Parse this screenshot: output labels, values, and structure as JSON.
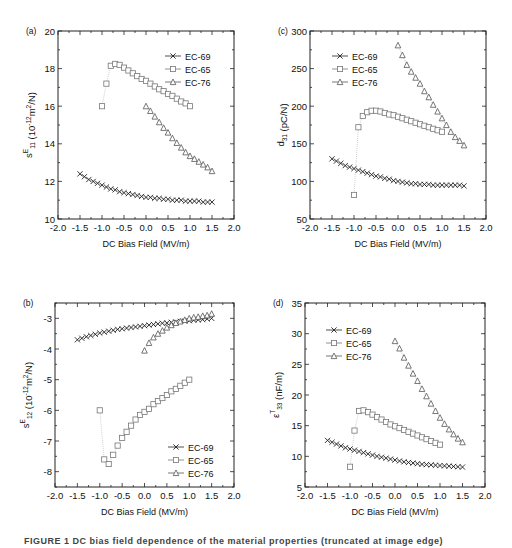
{
  "figure": {
    "caption_visible_fragment": "FIGURE 1 DC bias field dependence of the material properties (truncated at image edge)",
    "common_xlabel": "DC Bias Field (MV/m)"
  },
  "chart_data": [
    {
      "panel": "(a)",
      "type": "scatter",
      "title": "",
      "xlabel": "DC Bias Field (MV/m)",
      "ylabel": "s^E_11 (10^-12 m^2/N)",
      "ylabel_parts": {
        "base": "s",
        "sup": "E",
        "sub": "11",
        "unit": " (10",
        "unit_sup": "-12",
        "unit_tail": "m",
        "unit_sup2": "2",
        "unit_end": "/N)"
      },
      "xlim": [
        -2.0,
        2.0
      ],
      "ylim": [
        10,
        20
      ],
      "xticks": [
        -2.0,
        -1.5,
        -1.0,
        -0.5,
        0.0,
        0.5,
        1.0,
        1.5,
        2.0
      ],
      "yticks": [
        10,
        12,
        14,
        16,
        18,
        20
      ],
      "grid": false,
      "legend_position": "upper right",
      "frame": {
        "x0": 58,
        "y0": 31,
        "x1": 234,
        "y1": 219
      },
      "legend": {
        "x": 165,
        "y": 56
      },
      "series": [
        {
          "name": "EC-69",
          "marker": "x",
          "color": "#222222",
          "x": [
            -1.5,
            -1.4,
            -1.3,
            -1.2,
            -1.1,
            -1.0,
            -0.9,
            -0.8,
            -0.7,
            -0.6,
            -0.5,
            -0.4,
            -0.3,
            -0.2,
            -0.1,
            0.0,
            0.1,
            0.2,
            0.3,
            0.4,
            0.5,
            0.6,
            0.7,
            0.8,
            0.9,
            1.0,
            1.1,
            1.2,
            1.3,
            1.4,
            1.5
          ],
          "y": [
            12.4,
            12.25,
            12.1,
            12.0,
            11.9,
            11.8,
            11.7,
            11.6,
            11.55,
            11.45,
            11.4,
            11.35,
            11.3,
            11.25,
            11.2,
            11.15,
            11.15,
            11.1,
            11.1,
            11.05,
            11.05,
            11.0,
            11.0,
            11.0,
            10.95,
            10.95,
            10.95,
            10.95,
            10.9,
            10.9,
            10.9
          ]
        },
        {
          "name": "EC-65",
          "marker": "square",
          "color": "#777777",
          "x": [
            -1.0,
            -0.9,
            -0.8,
            -0.7,
            -0.6,
            -0.5,
            -0.4,
            -0.3,
            -0.2,
            -0.1,
            0.0,
            0.1,
            0.2,
            0.3,
            0.4,
            0.5,
            0.6,
            0.7,
            0.8,
            0.9,
            1.0
          ],
          "y": [
            16.0,
            17.2,
            18.15,
            18.25,
            18.2,
            18.05,
            17.9,
            17.75,
            17.6,
            17.45,
            17.35,
            17.2,
            17.05,
            16.9,
            16.8,
            16.65,
            16.55,
            16.4,
            16.25,
            16.15,
            16.0
          ]
        },
        {
          "name": "EC-76",
          "marker": "triangle",
          "color": "#555555",
          "x": [
            0.0,
            0.1,
            0.2,
            0.3,
            0.4,
            0.5,
            0.6,
            0.7,
            0.8,
            0.9,
            1.0,
            1.1,
            1.2,
            1.3,
            1.4,
            1.5
          ],
          "y": [
            16.0,
            15.75,
            15.45,
            15.15,
            14.85,
            14.6,
            14.3,
            14.05,
            13.8,
            13.55,
            13.35,
            13.2,
            13.05,
            12.9,
            12.75,
            12.55
          ]
        }
      ]
    },
    {
      "panel": "(c)",
      "type": "scatter",
      "title": "",
      "xlabel": "DC Bias Field (MV/m)",
      "ylabel": "d_31 (pC/N)",
      "ylabel_parts": {
        "base": "d",
        "sup": "",
        "sub": "31",
        "unit": " (pC/N)",
        "unit_sup": "",
        "unit_tail": "",
        "unit_sup2": "",
        "unit_end": ""
      },
      "xlim": [
        -2.0,
        2.0
      ],
      "ylim": [
        50,
        300
      ],
      "xticks": [
        -2.0,
        -1.5,
        -1.0,
        -0.5,
        0.0,
        0.5,
        1.0,
        1.5,
        2.0
      ],
      "yticks": [
        50,
        100,
        150,
        200,
        250,
        300
      ],
      "grid": false,
      "legend_position": "upper left",
      "frame": {
        "x0": 310,
        "y0": 31,
        "x1": 486,
        "y1": 219
      },
      "legend": {
        "x": 332,
        "y": 56
      },
      "series": [
        {
          "name": "EC-69",
          "marker": "x",
          "color": "#222222",
          "x": [
            -1.5,
            -1.4,
            -1.3,
            -1.2,
            -1.1,
            -1.0,
            -0.9,
            -0.8,
            -0.7,
            -0.6,
            -0.5,
            -0.4,
            -0.3,
            -0.2,
            -0.1,
            0.0,
            0.1,
            0.2,
            0.3,
            0.4,
            0.5,
            0.6,
            0.7,
            0.8,
            0.9,
            1.0,
            1.1,
            1.2,
            1.3,
            1.4,
            1.5
          ],
          "y": [
            130,
            127,
            124,
            121,
            119,
            117,
            115,
            113,
            111,
            109,
            107,
            106,
            104,
            103,
            101,
            100,
            99,
            98,
            97,
            97,
            96,
            96,
            96,
            95,
            95,
            95,
            95,
            95,
            95,
            95,
            94
          ]
        },
        {
          "name": "EC-65",
          "marker": "square",
          "color": "#777777",
          "x": [
            -1.0,
            -0.9,
            -0.8,
            -0.7,
            -0.6,
            -0.5,
            -0.4,
            -0.3,
            -0.2,
            -0.1,
            0.0,
            0.1,
            0.2,
            0.3,
            0.4,
            0.5,
            0.6,
            0.7,
            0.8,
            0.9,
            1.0
          ],
          "y": [
            82,
            172,
            187,
            192,
            194,
            194,
            193,
            191,
            189,
            188,
            186,
            184,
            182,
            180,
            178,
            176,
            174,
            172,
            170,
            168,
            166
          ]
        },
        {
          "name": "EC-76",
          "marker": "triangle",
          "color": "#555555",
          "x": [
            0.0,
            0.1,
            0.2,
            0.3,
            0.4,
            0.5,
            0.6,
            0.7,
            0.8,
            0.9,
            1.0,
            1.1,
            1.2,
            1.3,
            1.4,
            1.5
          ],
          "y": [
            281,
            268,
            255,
            246,
            238,
            230,
            220,
            212,
            202,
            193,
            184,
            175,
            166,
            159,
            154,
            148
          ]
        }
      ]
    },
    {
      "panel": "(b)",
      "type": "scatter",
      "title": "",
      "xlabel": "DC Bias Field (MV/m)",
      "ylabel": "s^E_12 (10^-12 m^2/N)",
      "ylabel_parts": {
        "base": "s",
        "sup": "E",
        "sub": "12",
        "unit": " (10",
        "unit_sup": "-12",
        "unit_tail": "m",
        "unit_sup2": "2",
        "unit_end": "/N)"
      },
      "xlim": [
        -2.0,
        2.0
      ],
      "ylim": [
        -8.5,
        -2.5
      ],
      "xticks": [
        -2.0,
        -1.5,
        -1.0,
        -0.5,
        0.0,
        0.5,
        1.0,
        1.5,
        2.0
      ],
      "yticks": [
        -8,
        -7,
        -6,
        -5,
        -4,
        -3
      ],
      "grid": false,
      "legend_position": "lower right",
      "frame": {
        "x0": 55,
        "y0": 303,
        "x1": 234,
        "y1": 487
      },
      "legend": {
        "x": 168,
        "y": 447
      },
      "series": [
        {
          "name": "EC-69",
          "marker": "x",
          "color": "#222222",
          "x": [
            -1.5,
            -1.4,
            -1.3,
            -1.2,
            -1.1,
            -1.0,
            -0.9,
            -0.8,
            -0.7,
            -0.6,
            -0.5,
            -0.4,
            -0.3,
            -0.2,
            -0.1,
            0.0,
            0.1,
            0.2,
            0.3,
            0.4,
            0.5,
            0.6,
            0.7,
            0.8,
            0.9,
            1.0,
            1.1,
            1.2,
            1.3,
            1.4,
            1.5
          ],
          "y": [
            -3.7,
            -3.65,
            -3.6,
            -3.56,
            -3.52,
            -3.48,
            -3.45,
            -3.42,
            -3.39,
            -3.36,
            -3.34,
            -3.32,
            -3.3,
            -3.28,
            -3.26,
            -3.24,
            -3.22,
            -3.2,
            -3.18,
            -3.16,
            -3.15,
            -3.13,
            -3.12,
            -3.1,
            -3.09,
            -3.08,
            -3.06,
            -3.05,
            -3.04,
            -3.02,
            -3.0
          ]
        },
        {
          "name": "EC-65",
          "marker": "square",
          "color": "#777777",
          "x": [
            -1.0,
            -0.9,
            -0.8,
            -0.7,
            -0.6,
            -0.5,
            -0.4,
            -0.3,
            -0.2,
            -0.1,
            0.0,
            0.1,
            0.2,
            0.3,
            0.4,
            0.5,
            0.6,
            0.7,
            0.8,
            0.9,
            1.0
          ],
          "y": [
            -6.0,
            -7.6,
            -7.75,
            -7.45,
            -7.15,
            -6.9,
            -6.7,
            -6.5,
            -6.3,
            -6.15,
            -6.05,
            -5.95,
            -5.8,
            -5.7,
            -5.6,
            -5.5,
            -5.38,
            -5.3,
            -5.2,
            -5.1,
            -5.0
          ]
        },
        {
          "name": "EC-76",
          "marker": "triangle",
          "color": "#555555",
          "x": [
            0.0,
            0.1,
            0.2,
            0.3,
            0.4,
            0.5,
            0.6,
            0.7,
            0.8,
            0.9,
            1.0,
            1.1,
            1.2,
            1.3,
            1.4,
            1.5
          ],
          "y": [
            -4.05,
            -3.8,
            -3.62,
            -3.5,
            -3.4,
            -3.3,
            -3.22,
            -3.15,
            -3.1,
            -3.05,
            -3.0,
            -2.97,
            -2.95,
            -2.92,
            -2.9,
            -2.85
          ]
        }
      ]
    },
    {
      "panel": "(d)",
      "type": "scatter",
      "title": "",
      "xlabel": "DC Bias Field (MV/m)",
      "ylabel": "ε^T_33 (nF/m)",
      "ylabel_parts": {
        "base": "ε",
        "sup": "T",
        "sub": "33",
        "unit": " (nF/m)",
        "unit_sup": "",
        "unit_tail": "",
        "unit_sup2": "",
        "unit_end": ""
      },
      "xlim": [
        -2.0,
        2.0
      ],
      "ylim": [
        5,
        35
      ],
      "xticks": [
        -2.0,
        -1.5,
        -1.0,
        -0.5,
        0.0,
        0.5,
        1.0,
        1.5,
        2.0
      ],
      "yticks": [
        5,
        10,
        15,
        20,
        25,
        30,
        35
      ],
      "grid": false,
      "legend_position": "upper left",
      "frame": {
        "x0": 305,
        "y0": 303,
        "x1": 485,
        "y1": 487
      },
      "legend": {
        "x": 326,
        "y": 330
      },
      "series": [
        {
          "name": "EC-69",
          "marker": "x",
          "color": "#222222",
          "x": [
            -1.5,
            -1.4,
            -1.3,
            -1.2,
            -1.1,
            -1.0,
            -0.9,
            -0.8,
            -0.7,
            -0.6,
            -0.5,
            -0.4,
            -0.3,
            -0.2,
            -0.1,
            0.0,
            0.1,
            0.2,
            0.3,
            0.4,
            0.5,
            0.6,
            0.7,
            0.8,
            0.9,
            1.0,
            1.1,
            1.2,
            1.3,
            1.4,
            1.5
          ],
          "y": [
            12.6,
            12.3,
            12.0,
            11.7,
            11.4,
            11.2,
            11.0,
            10.8,
            10.6,
            10.4,
            10.2,
            10.0,
            9.85,
            9.7,
            9.55,
            9.4,
            9.25,
            9.1,
            9.0,
            8.9,
            8.8,
            8.7,
            8.65,
            8.6,
            8.55,
            8.5,
            8.45,
            8.4,
            8.35,
            8.3,
            8.25
          ]
        },
        {
          "name": "EC-65",
          "marker": "square",
          "color": "#777777",
          "x": [
            -1.0,
            -0.9,
            -0.8,
            -0.7,
            -0.6,
            -0.5,
            -0.4,
            -0.3,
            -0.2,
            -0.1,
            0.0,
            0.1,
            0.2,
            0.3,
            0.4,
            0.5,
            0.6,
            0.7,
            0.8,
            0.9,
            1.0
          ],
          "y": [
            8.3,
            14.2,
            17.4,
            17.5,
            17.2,
            16.8,
            16.4,
            16.0,
            15.6,
            15.2,
            14.9,
            14.6,
            14.3,
            14.0,
            13.7,
            13.4,
            13.1,
            12.8,
            12.5,
            12.2,
            11.9
          ]
        },
        {
          "name": "EC-76",
          "marker": "triangle",
          "color": "#555555",
          "x": [
            0.0,
            0.1,
            0.2,
            0.3,
            0.4,
            0.5,
            0.6,
            0.7,
            0.8,
            0.9,
            1.0,
            1.1,
            1.2,
            1.3,
            1.4,
            1.5
          ],
          "y": [
            28.8,
            27.6,
            26.1,
            24.8,
            23.5,
            22.3,
            21.0,
            19.8,
            18.6,
            17.4,
            16.3,
            15.3,
            14.4,
            13.6,
            12.9,
            12.3
          ]
        }
      ]
    }
  ]
}
